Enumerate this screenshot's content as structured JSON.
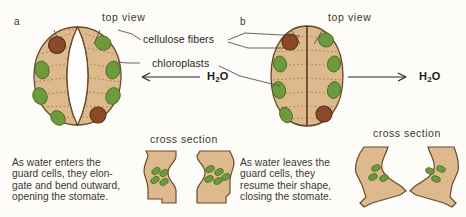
{
  "figure": {
    "panels": [
      {
        "letter": "a",
        "view_label": "top view",
        "state": "open",
        "water_label": "H2O",
        "water_direction": "in",
        "cross_section_label": "cross section",
        "caption_lines": [
          "As water enters the",
          "guard cells, they elon-",
          "gate and bend outward,",
          "opening the stomate."
        ]
      },
      {
        "letter": "b",
        "view_label": "top view",
        "state": "closed",
        "water_label": "H2O",
        "water_direction": "out",
        "cross_section_label": "cross section",
        "caption_lines": [
          "As water leaves the",
          "guard cells, they",
          "resume their shape,",
          "closing the stomate."
        ]
      }
    ],
    "callouts": [
      {
        "label": "cellulose fibers"
      },
      {
        "label": "chloroplasts"
      }
    ],
    "colors": {
      "cell_fill": "#ddba8e",
      "cell_outline": "#6b4a2a",
      "chloroplast": "#6d9a3c",
      "chloroplast_outline": "#4a6b28",
      "nucleus": "#8a4a28",
      "nucleus_outline": "#5d2f18",
      "fiber": "#b07a4a",
      "background": "#fdfcf8",
      "text": "#3a3732",
      "leader_line": "#4a4a52"
    }
  }
}
